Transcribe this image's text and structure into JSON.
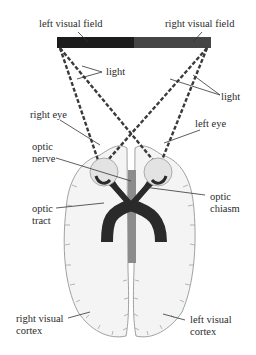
{
  "diagram": {
    "labels": {
      "left_visual_field": "left visual field",
      "right_visual_field": "right visual field",
      "light_left": "light",
      "light_right": "light",
      "right_eye": "right eye",
      "left_eye": "left eye",
      "optic_nerve_line1": "optic",
      "optic_nerve_line2": "nerve",
      "optic_chiasm_line1": "optic",
      "optic_chiasm_line2": "chiasm",
      "optic_tract_line1": "optic",
      "optic_tract_line2": "tract",
      "right_visual_cortex_line1": "right visual",
      "right_visual_cortex_line2": "cortex",
      "left_visual_cortex_line1": "left visual",
      "left_visual_cortex_line2": "cortex"
    },
    "colors": {
      "left_field": "#1c1c1c",
      "right_field": "#454545",
      "nerve": "#2a2a2a",
      "eye_fill": "#e3e3e3",
      "brain_fill": "#f4f4f4",
      "brain_outline": "#8a8a8a",
      "midline": "#8c8c8c",
      "leader": "#333333"
    }
  }
}
